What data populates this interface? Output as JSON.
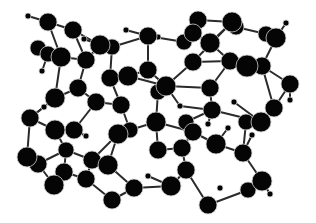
{
  "diagram": {
    "type": "ball-and-stick molecular structure",
    "background": "#ffffff",
    "atom_color": "#050505",
    "atom_rim_color": "#cfcfcf",
    "bond_color": "#2a2a2a",
    "atoms": [
      {
        "id": 0,
        "x": 28,
        "y": 16,
        "r": 3
      },
      {
        "id": 1,
        "x": 48,
        "y": 22,
        "r": 9
      },
      {
        "id": 2,
        "x": 73,
        "y": 30,
        "r": 9
      },
      {
        "id": 3,
        "x": 38,
        "y": 48,
        "r": 8
      },
      {
        "id": 4,
        "x": 48,
        "y": 54,
        "r": 8
      },
      {
        "id": 5,
        "x": 61,
        "y": 57,
        "r": 10
      },
      {
        "id": 6,
        "x": 86,
        "y": 60,
        "r": 9
      },
      {
        "id": 7,
        "x": 42,
        "y": 71,
        "r": 3
      },
      {
        "id": 8,
        "x": 84,
        "y": 39,
        "r": 3
      },
      {
        "id": 9,
        "x": 100,
        "y": 45,
        "r": 10
      },
      {
        "id": 10,
        "x": 112,
        "y": 47,
        "r": 8
      },
      {
        "id": 11,
        "x": 126,
        "y": 30,
        "r": 3
      },
      {
        "id": 12,
        "x": 148,
        "y": 36,
        "r": 9
      },
      {
        "id": 13,
        "x": 158,
        "y": 37,
        "r": 3
      },
      {
        "id": 14,
        "x": 184,
        "y": 42,
        "r": 8
      },
      {
        "id": 15,
        "x": 198,
        "y": 20,
        "r": 9
      },
      {
        "id": 16,
        "x": 193,
        "y": 33,
        "r": 9
      },
      {
        "id": 17,
        "x": 210,
        "y": 43,
        "r": 10
      },
      {
        "id": 18,
        "x": 232,
        "y": 22,
        "r": 10
      },
      {
        "id": 19,
        "x": 236,
        "y": 27,
        "r": 8
      },
      {
        "id": 20,
        "x": 266,
        "y": 34,
        "r": 8
      },
      {
        "id": 21,
        "x": 276,
        "y": 38,
        "r": 10
      },
      {
        "id": 22,
        "x": 286,
        "y": 23,
        "r": 3
      },
      {
        "id": 23,
        "x": 193,
        "y": 62,
        "r": 9
      },
      {
        "id": 24,
        "x": 230,
        "y": 61,
        "r": 9
      },
      {
        "id": 25,
        "x": 247,
        "y": 66,
        "r": 11
      },
      {
        "id": 26,
        "x": 262,
        "y": 66,
        "r": 9
      },
      {
        "id": 27,
        "x": 290,
        "y": 84,
        "r": 9
      },
      {
        "id": 28,
        "x": 290,
        "y": 100,
        "r": 3
      },
      {
        "id": 29,
        "x": 30,
        "y": 118,
        "r": 9
      },
      {
        "id": 30,
        "x": 55,
        "y": 98,
        "r": 10
      },
      {
        "id": 31,
        "x": 78,
        "y": 88,
        "r": 9
      },
      {
        "id": 32,
        "x": 96,
        "y": 102,
        "r": 9
      },
      {
        "id": 33,
        "x": 110,
        "y": 78,
        "r": 9
      },
      {
        "id": 34,
        "x": 128,
        "y": 76,
        "r": 10
      },
      {
        "id": 35,
        "x": 148,
        "y": 70,
        "r": 9
      },
      {
        "id": 36,
        "x": 121,
        "y": 105,
        "r": 9
      },
      {
        "id": 37,
        "x": 166,
        "y": 86,
        "r": 10
      },
      {
        "id": 38,
        "x": 158,
        "y": 92,
        "r": 8
      },
      {
        "id": 39,
        "x": 180,
        "y": 106,
        "r": 3
      },
      {
        "id": 40,
        "x": 210,
        "y": 88,
        "r": 9
      },
      {
        "id": 41,
        "x": 212,
        "y": 110,
        "r": 9
      },
      {
        "id": 42,
        "x": 208,
        "y": 124,
        "r": 3
      },
      {
        "id": 43,
        "x": 246,
        "y": 122,
        "r": 8
      },
      {
        "id": 44,
        "x": 261,
        "y": 122,
        "r": 10
      },
      {
        "id": 45,
        "x": 274,
        "y": 108,
        "r": 9
      },
      {
        "id": 46,
        "x": 44,
        "y": 107,
        "r": 3
      },
      {
        "id": 47,
        "x": 27,
        "y": 157,
        "r": 10
      },
      {
        "id": 48,
        "x": 38,
        "y": 164,
        "r": 9
      },
      {
        "id": 49,
        "x": 55,
        "y": 130,
        "r": 10
      },
      {
        "id": 50,
        "x": 66,
        "y": 150,
        "r": 8
      },
      {
        "id": 51,
        "x": 74,
        "y": 130,
        "r": 9
      },
      {
        "id": 52,
        "x": 86,
        "y": 136,
        "r": 3
      },
      {
        "id": 53,
        "x": 92,
        "y": 160,
        "r": 9
      },
      {
        "id": 54,
        "x": 108,
        "y": 165,
        "r": 10
      },
      {
        "id": 55,
        "x": 118,
        "y": 134,
        "r": 10
      },
      {
        "id": 56,
        "x": 130,
        "y": 130,
        "r": 8
      },
      {
        "id": 57,
        "x": 156,
        "y": 122,
        "r": 10
      },
      {
        "id": 58,
        "x": 158,
        "y": 150,
        "r": 9
      },
      {
        "id": 59,
        "x": 182,
        "y": 148,
        "r": 9
      },
      {
        "id": 60,
        "x": 193,
        "y": 132,
        "r": 9
      },
      {
        "id": 61,
        "x": 216,
        "y": 144,
        "r": 10
      },
      {
        "id": 62,
        "x": 228,
        "y": 128,
        "r": 3
      },
      {
        "id": 63,
        "x": 243,
        "y": 153,
        "r": 9
      },
      {
        "id": 64,
        "x": 252,
        "y": 135,
        "r": 3
      },
      {
        "id": 65,
        "x": 54,
        "y": 185,
        "r": 10
      },
      {
        "id": 66,
        "x": 64,
        "y": 172,
        "r": 9
      },
      {
        "id": 67,
        "x": 86,
        "y": 179,
        "r": 9
      },
      {
        "id": 68,
        "x": 112,
        "y": 200,
        "r": 9
      },
      {
        "id": 69,
        "x": 134,
        "y": 188,
        "r": 9
      },
      {
        "id": 70,
        "x": 171,
        "y": 186,
        "r": 10
      },
      {
        "id": 71,
        "x": 186,
        "y": 170,
        "r": 9
      },
      {
        "id": 72,
        "x": 208,
        "y": 205,
        "r": 9
      },
      {
        "id": 73,
        "x": 220,
        "y": 188,
        "r": 3
      },
      {
        "id": 74,
        "x": 248,
        "y": 190,
        "r": 8
      },
      {
        "id": 75,
        "x": 262,
        "y": 181,
        "r": 10
      },
      {
        "id": 76,
        "x": 270,
        "y": 194,
        "r": 3
      },
      {
        "id": 77,
        "x": 186,
        "y": 122,
        "r": 8
      },
      {
        "id": 78,
        "x": 234,
        "y": 102,
        "r": 3
      },
      {
        "id": 79,
        "x": 148,
        "y": 176,
        "r": 3
      }
    ],
    "bonds": [
      [
        0,
        1
      ],
      [
        1,
        2
      ],
      [
        1,
        5
      ],
      [
        2,
        9
      ],
      [
        2,
        6
      ],
      [
        3,
        4
      ],
      [
        4,
        5
      ],
      [
        5,
        6
      ],
      [
        4,
        7
      ],
      [
        5,
        30
      ],
      [
        6,
        9
      ],
      [
        8,
        9
      ],
      [
        9,
        10
      ],
      [
        10,
        12
      ],
      [
        11,
        12
      ],
      [
        12,
        13
      ],
      [
        12,
        14
      ],
      [
        14,
        16
      ],
      [
        15,
        16
      ],
      [
        15,
        18
      ],
      [
        16,
        17
      ],
      [
        17,
        18
      ],
      [
        18,
        19
      ],
      [
        19,
        20
      ],
      [
        20,
        21
      ],
      [
        21,
        22
      ],
      [
        18,
        23
      ],
      [
        17,
        24
      ],
      [
        23,
        24
      ],
      [
        24,
        25
      ],
      [
        25,
        26
      ],
      [
        26,
        21
      ],
      [
        26,
        27
      ],
      [
        27,
        28
      ],
      [
        6,
        31
      ],
      [
        10,
        33
      ],
      [
        33,
        34
      ],
      [
        34,
        35
      ],
      [
        35,
        12
      ],
      [
        30,
        31
      ],
      [
        31,
        32
      ],
      [
        30,
        29
      ],
      [
        29,
        46
      ],
      [
        32,
        36
      ],
      [
        33,
        36
      ],
      [
        34,
        37
      ],
      [
        35,
        37
      ],
      [
        37,
        38
      ],
      [
        23,
        37
      ],
      [
        37,
        40
      ],
      [
        40,
        41
      ],
      [
        41,
        42
      ],
      [
        40,
        24
      ],
      [
        41,
        44
      ],
      [
        43,
        44
      ],
      [
        44,
        45
      ],
      [
        45,
        27
      ],
      [
        45,
        26
      ],
      [
        29,
        47
      ],
      [
        47,
        48
      ],
      [
        29,
        49
      ],
      [
        49,
        51
      ],
      [
        51,
        52
      ],
      [
        51,
        32
      ],
      [
        49,
        50
      ],
      [
        50,
        53
      ],
      [
        53,
        54
      ],
      [
        54,
        55
      ],
      [
        55,
        56
      ],
      [
        56,
        36
      ],
      [
        56,
        57
      ],
      [
        57,
        38
      ],
      [
        57,
        58
      ],
      [
        58,
        59
      ],
      [
        59,
        60
      ],
      [
        60,
        77
      ],
      [
        77,
        41
      ],
      [
        60,
        61
      ],
      [
        61,
        62
      ],
      [
        61,
        63
      ],
      [
        63,
        64
      ],
      [
        63,
        43
      ],
      [
        48,
        65
      ],
      [
        65,
        66
      ],
      [
        66,
        67
      ],
      [
        67,
        53
      ],
      [
        67,
        68
      ],
      [
        68,
        69
      ],
      [
        69,
        54
      ],
      [
        69,
        70
      ],
      [
        70,
        71
      ],
      [
        71,
        59
      ],
      [
        71,
        72
      ],
      [
        72,
        74
      ],
      [
        74,
        75
      ],
      [
        75,
        76
      ],
      [
        75,
        63
      ],
      [
        78,
        44
      ],
      [
        79,
        70
      ],
      [
        55,
        53
      ],
      [
        48,
        50
      ],
      [
        66,
        50
      ],
      [
        39,
        37
      ],
      [
        39,
        41
      ],
      [
        57,
        60
      ]
    ]
  }
}
